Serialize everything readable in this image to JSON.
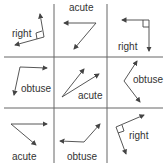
{
  "grid": {
    "rows": 3,
    "cols": 3,
    "line_color": "#555555"
  },
  "cells": [
    {
      "row": 0,
      "col": 0,
      "label": "right"
    },
    {
      "row": 0,
      "col": 1,
      "label": "acute"
    },
    {
      "row": 0,
      "col": 2,
      "label": "right"
    },
    {
      "row": 1,
      "col": 0,
      "label": "obtuse"
    },
    {
      "row": 1,
      "col": 1,
      "label": "acute"
    },
    {
      "row": 1,
      "col": 2,
      "label": "obtuse"
    },
    {
      "row": 2,
      "col": 0,
      "label": "acute"
    },
    {
      "row": 2,
      "col": 1,
      "label": "obtuse"
    },
    {
      "row": 2,
      "col": 2,
      "label": "right"
    }
  ],
  "colors": {
    "arrow": "#444444",
    "text": "#333333"
  }
}
